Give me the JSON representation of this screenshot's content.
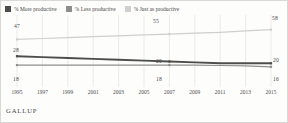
{
  "legend": {
    "items": [
      {
        "label": "% More productive",
        "color": "#4d4d4d"
      },
      {
        "label": "% Less productive",
        "color": "#8e8e8e"
      },
      {
        "label": "% Just as productive",
        "color": "#cfcfcf"
      }
    ]
  },
  "brand": {
    "name": "GALLUP",
    "mark": "·"
  },
  "chart_data": {
    "type": "line",
    "title": "",
    "xlabel": "",
    "ylabel": "",
    "grid": "vertical",
    "legend_position": "top-left",
    "x": [
      1995,
      1997,
      1999,
      2001,
      2003,
      2005,
      2007,
      2009,
      2011,
      2013,
      2015
    ],
    "categories": [
      "1995",
      "1997",
      "1999",
      "2001",
      "2003",
      "2005",
      "2007",
      "2009",
      "2011",
      "2013",
      "2015"
    ],
    "ylim": [
      0,
      70
    ],
    "series": [
      {
        "name": "% Just as productive",
        "color": "#cfcfcf",
        "values": [
          47,
          48,
          49,
          50,
          51,
          52,
          53,
          54,
          55,
          56.5,
          58
        ],
        "labels": [
          {
            "x": 1995,
            "value": "47"
          },
          {
            "x": 2007,
            "value": "55"
          },
          {
            "x": 2015,
            "value": "58"
          }
        ]
      },
      {
        "name": "% More productive",
        "color": "#4d4d4d",
        "values": [
          28,
          27,
          26,
          25,
          24,
          23,
          22,
          21,
          20,
          20,
          20
        ],
        "labels": [
          {
            "x": 1995,
            "value": "28"
          },
          {
            "x": 2007,
            "value": "20"
          },
          {
            "x": 2015,
            "value": "20"
          }
        ]
      },
      {
        "name": "% Less productive",
        "color": "#8e8e8e",
        "values": [
          18,
          18,
          18,
          18,
          18,
          18,
          18,
          18,
          17.5,
          17,
          16
        ],
        "labels": [
          {
            "x": 1995,
            "value": "18"
          },
          {
            "x": 2007,
            "value": "18"
          },
          {
            "x": 2015,
            "value": "16"
          }
        ]
      }
    ]
  },
  "axis_labels": {
    "x_ticks": [
      "1995",
      "1997",
      "1999",
      "2001",
      "2003",
      "2005",
      "2007",
      "2009",
      "2011",
      "2013",
      "2015"
    ]
  },
  "data_labels": {
    "just_left": "47",
    "just_mid": "55",
    "just_right": "58",
    "more_left": "28",
    "more_mid": "20",
    "more_right": "20",
    "less_left": "18",
    "less_mid": "18",
    "less_right": "16"
  }
}
